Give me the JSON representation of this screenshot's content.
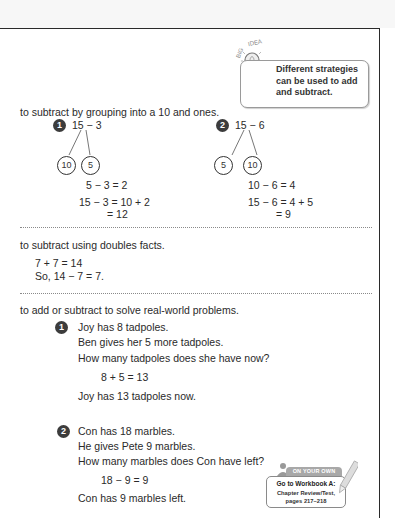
{
  "big_idea": {
    "label": "BIG IDEA",
    "lines": [
      "Different strategies",
      "can be used to add",
      "and subtract."
    ]
  },
  "section1": {
    "heading": "to subtract by grouping into a 10 and ones.",
    "problems": [
      {
        "number": "1",
        "expression": "15 − 3",
        "parts": [
          "10",
          "5"
        ],
        "step1": "5 − 3 = 2",
        "step2": "15 − 3 = 10 + 2",
        "step3": "= 12"
      },
      {
        "number": "2",
        "expression": "15 − 6",
        "parts": [
          "5",
          "10"
        ],
        "step1": "10 − 6 = 4",
        "step2": "15 − 6 = 4 + 5",
        "step3": "= 9"
      }
    ]
  },
  "section2": {
    "heading": "to subtract using doubles facts.",
    "lines": [
      "7 + 7 = 14",
      "So, 14 − 7 = 7."
    ]
  },
  "section3": {
    "heading": "to add or subtract to solve real-world problems.",
    "problems": [
      {
        "number": "1",
        "lines": [
          "Joy has 8 tadpoles.",
          "Ben gives her 5 more tadpoles.",
          "How many tadpoles does she have now?"
        ],
        "equation": "8 + 5 = 13",
        "answer": "Joy has 13 tadpoles now."
      },
      {
        "number": "2",
        "lines": [
          "Con has 18 marbles.",
          "He gives Pete 9 marbles.",
          "How many marbles does Con have left?"
        ],
        "equation": "18 − 9 = 9",
        "answer": "Con has 9 marbles left."
      }
    ]
  },
  "on_your_own": {
    "tab": "ON YOUR OWN",
    "line1": "Go to Workbook A:",
    "line2": "Chapter Review/Test,",
    "line3": "pages 217–218"
  }
}
